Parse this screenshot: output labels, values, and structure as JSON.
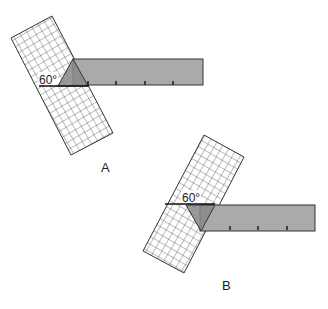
{
  "figure": {
    "panels": [
      {
        "id": "A",
        "label": "A",
        "angle_label": "60°",
        "bar": {
          "x": 73,
          "y": 59,
          "w": 130,
          "h": 26,
          "ticks": 4
        },
        "grid": {
          "cols": 6,
          "rows": 12
        }
      },
      {
        "id": "B",
        "label": "B",
        "angle_label": "60°",
        "bar": {
          "x": 200,
          "y": 205,
          "w": 115,
          "h": 26,
          "ticks": 3
        },
        "grid": {
          "cols": 6,
          "rows": 10
        }
      }
    ],
    "colors": {
      "bar_fill": "#aaaaaa",
      "overlap_fill": "#8a8a8a",
      "line": "#333333",
      "grid_line": "#444444"
    }
  }
}
